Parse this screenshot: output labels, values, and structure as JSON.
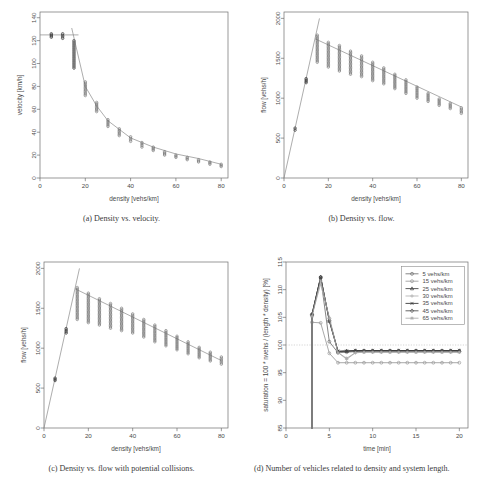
{
  "figure": {
    "panels": [
      {
        "id": "a",
        "caption": "(a)  Density vs. velocity.",
        "xlabel": "density [vehs/km]",
        "ylabel": "velocity [km/h]"
      },
      {
        "id": "b",
        "caption": "(b)  Density vs. flow.",
        "xlabel": "density [vehs/km]",
        "ylabel": "flow [vehs/h]"
      },
      {
        "id": "c",
        "caption": "(c)  Density vs. flow with potential collisions.",
        "xlabel": "density [vehs/km]",
        "ylabel": "flow [vehs/h]"
      },
      {
        "id": "d",
        "caption": "(d)  Number of vehicles related to density and system length.",
        "xlabel": "time [min]",
        "ylabel": "saturation = 100 * nvehs / (length * density) [%]"
      }
    ]
  },
  "chart_data": [
    {
      "type": "scatter",
      "panel": "a",
      "title": "Density vs. velocity.",
      "xlabel": "density [vehs/km]",
      "ylabel": "velocity [km/h]",
      "xlim": [
        0,
        83
      ],
      "ylim": [
        0,
        145
      ],
      "xticks": [
        0,
        20,
        40,
        60,
        80
      ],
      "yticks": [
        0,
        20,
        40,
        60,
        80,
        100,
        120,
        140
      ],
      "grid": false,
      "legend": null,
      "series": [
        {
          "name": "simulated velocity samples",
          "marker": "open-circle",
          "x": [
            5,
            10,
            15,
            15,
            20,
            25,
            30,
            35,
            40,
            45,
            50,
            55,
            60,
            65,
            70,
            75,
            80
          ],
          "y": [
            125,
            125,
            112,
            101,
            79,
            62,
            48,
            40,
            34,
            29,
            25,
            21,
            19,
            17,
            15,
            13,
            11
          ],
          "spread_low": [
            123,
            122,
            96,
            96,
            72,
            58,
            45,
            37,
            32,
            27,
            24,
            20,
            18,
            16,
            14,
            12,
            10
          ],
          "spread_high": [
            126,
            126,
            120,
            120,
            84,
            66,
            51,
            43,
            36,
            31,
            27,
            23,
            20,
            18,
            16,
            14,
            12
          ]
        },
        {
          "name": "free-flow branch (fit)",
          "type": "line",
          "x": [
            0,
            17
          ],
          "y": [
            125,
            125
          ]
        },
        {
          "name": "congested branch (fit)",
          "type": "line",
          "x": [
            14,
            20,
            25,
            30,
            40,
            50,
            60,
            70,
            80
          ],
          "y": [
            131,
            80,
            63,
            50,
            35,
            27,
            21,
            17,
            12
          ]
        }
      ]
    },
    {
      "type": "scatter",
      "panel": "b",
      "title": "Density vs. flow.",
      "xlabel": "density [vehs/km]",
      "ylabel": "flow [vehs/h]",
      "xlim": [
        0,
        83
      ],
      "ylim": [
        0,
        2080
      ],
      "xticks": [
        0,
        20,
        40,
        60,
        80
      ],
      "yticks": [
        0,
        500,
        1000,
        1500,
        2000
      ],
      "grid": false,
      "legend": null,
      "series": [
        {
          "name": "simulated flow samples",
          "marker": "open-circle",
          "x": [
            5,
            10,
            15,
            20,
            25,
            30,
            35,
            40,
            45,
            50,
            55,
            60,
            65,
            70,
            75,
            80
          ],
          "y": [
            615,
            1225,
            1700,
            1620,
            1570,
            1500,
            1450,
            1380,
            1310,
            1230,
            1160,
            1080,
            1010,
            950,
            900,
            845
          ],
          "spread_low": [
            600,
            1195,
            1450,
            1390,
            1340,
            1300,
            1270,
            1220,
            1180,
            1120,
            1060,
            1000,
            960,
            910,
            870,
            810
          ],
          "spread_high": [
            625,
            1245,
            1790,
            1700,
            1660,
            1590,
            1530,
            1450,
            1380,
            1300,
            1230,
            1140,
            1060,
            990,
            935,
            880
          ]
        },
        {
          "name": "free-flow line (fit)",
          "type": "line",
          "x": [
            0,
            16
          ],
          "y": [
            0,
            2000
          ]
        },
        {
          "name": "congested line (fit)",
          "type": "line",
          "x": [
            14,
            80
          ],
          "y": [
            1745,
            890
          ]
        }
      ]
    },
    {
      "type": "scatter",
      "panel": "c",
      "title": "Density vs. flow with potential collisions.",
      "xlabel": "density [vehs/km]",
      "ylabel": "flow [vehs/h]",
      "xlim": [
        0,
        83
      ],
      "ylim": [
        0,
        2080
      ],
      "xticks": [
        0,
        20,
        40,
        60,
        80
      ],
      "yticks": [
        0,
        500,
        1000,
        1500,
        2000
      ],
      "grid": false,
      "legend": null,
      "series": [
        {
          "name": "simulated flow samples (with collisions)",
          "marker": "open-circle",
          "x": [
            5,
            10,
            15,
            20,
            25,
            30,
            35,
            40,
            45,
            50,
            55,
            60,
            65,
            70,
            75,
            80
          ],
          "y": [
            610,
            1220,
            1660,
            1590,
            1520,
            1460,
            1410,
            1350,
            1280,
            1210,
            1140,
            1070,
            1000,
            940,
            890,
            840
          ],
          "spread_low": [
            595,
            1190,
            1360,
            1320,
            1290,
            1250,
            1220,
            1190,
            1140,
            1080,
            1030,
            980,
            930,
            880,
            840,
            800
          ],
          "spread_high": [
            625,
            1245,
            1760,
            1690,
            1620,
            1560,
            1500,
            1430,
            1360,
            1290,
            1220,
            1150,
            1080,
            1010,
            950,
            890
          ]
        },
        {
          "name": "free-flow line (fit)",
          "type": "line",
          "x": [
            0,
            16
          ],
          "y": [
            0,
            2000
          ]
        },
        {
          "name": "congested line (fit)",
          "type": "line",
          "x": [
            14,
            80
          ],
          "y": [
            1745,
            845
          ]
        }
      ]
    },
    {
      "type": "line",
      "panel": "d",
      "title": "Number of vehicles related to density and system length.",
      "xlabel": "time [min]",
      "ylabel": "saturation = 100 * nvehs / (length * density) [%]",
      "xlim": [
        0,
        21
      ],
      "ylim": [
        85,
        115
      ],
      "xticks": [
        0,
        5,
        10,
        15,
        20
      ],
      "yticks": [
        85,
        90,
        95,
        100,
        105,
        110,
        115
      ],
      "grid": false,
      "reference_line": 100,
      "legend_position": "top-right",
      "x": [
        3,
        4,
        5,
        6,
        7,
        8,
        9,
        10,
        11,
        12,
        13,
        14,
        15,
        16,
        17,
        18,
        19,
        20
      ],
      "series": [
        {
          "name": "5 vehs/km",
          "marker": "open-circle",
          "values": [
            105.3,
            112.2,
            100.6,
            98.6,
            98.7,
            98.8,
            98.8,
            98.8,
            98.8,
            98.8,
            98.8,
            98.8,
            98.8,
            98.8,
            98.8,
            98.8,
            98.8,
            98.8
          ]
        },
        {
          "name": "15 vehs/km",
          "marker": "open-circle",
          "values": [
            104.1,
            104.0,
            98.5,
            96.8,
            96.8,
            96.8,
            96.8,
            96.8,
            96.8,
            96.8,
            96.8,
            96.8,
            96.8,
            96.8,
            96.8,
            96.8,
            96.8,
            96.8
          ]
        },
        {
          "name": "25 vehs/km",
          "marker": "triangle",
          "values": [
            105.6,
            112.3,
            104.3,
            98.8,
            98.9,
            99.0,
            99.0,
            99.0,
            99.0,
            99.0,
            99.0,
            99.0,
            99.0,
            99.0,
            99.0,
            99.0,
            99.0,
            99.0
          ]
        },
        {
          "name": "30 vehs/km",
          "marker": "plus",
          "values": [
            105.4,
            111.0,
            105.0,
            98.7,
            97.4,
            98.6,
            98.7,
            98.7,
            98.7,
            98.7,
            98.7,
            98.7,
            98.7,
            98.7,
            98.7,
            98.7,
            98.7,
            98.7
          ]
        },
        {
          "name": "35 vehs/km",
          "marker": "cross",
          "values": [
            105.5,
            112.2,
            104.5,
            98.9,
            98.9,
            99.0,
            99.0,
            99.0,
            99.0,
            99.0,
            99.0,
            99.0,
            99.0,
            99.0,
            99.0,
            99.0,
            99.0,
            99.0
          ]
        },
        {
          "name": "45 vehs/km",
          "marker": "diamond",
          "values": [
            105.5,
            112.3,
            104.4,
            98.8,
            98.9,
            98.9,
            98.9,
            98.9,
            98.9,
            98.9,
            98.9,
            98.9,
            98.9,
            98.9,
            98.9,
            98.9,
            98.9,
            98.9
          ]
        },
        {
          "name": "65 vehs/km",
          "marker": "star",
          "values": [
            105.2,
            111.6,
            104.8,
            98.6,
            97.6,
            98.6,
            98.7,
            98.7,
            98.7,
            98.7,
            98.7,
            98.7,
            98.7,
            98.7,
            98.7,
            98.7,
            98.7,
            98.7
          ]
        }
      ]
    }
  ],
  "colors": {
    "axis": "#6e6e6e",
    "point": "#6f6f6f",
    "point_dark": "#3c3c3c",
    "fit_line": "#8a8a8a",
    "reference": "#b8b8b8",
    "text": "#4a4a4a",
    "caption": "#3a3a3a",
    "series": [
      "#707070",
      "#9a9a9a",
      "#3d3d3d",
      "#b0b0b0",
      "#2f2f2f",
      "#4a4a4a",
      "#aaaaaa"
    ]
  }
}
